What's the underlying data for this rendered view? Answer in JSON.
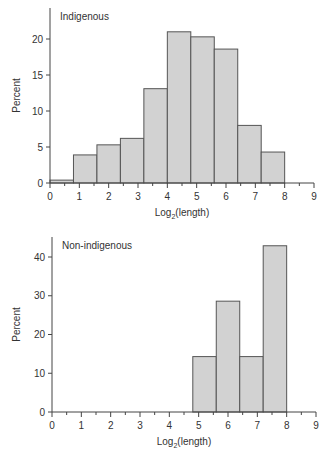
{
  "chart_data": [
    {
      "type": "bar",
      "title": "Indigenous",
      "xlabel": "Log2(length)",
      "ylabel": "Percent",
      "bin_edges": [
        0,
        0.8,
        1.6,
        2.4,
        3.2,
        4.0,
        4.8,
        5.6,
        6.4,
        7.2,
        8.0
      ],
      "values": [
        0.4,
        3.9,
        5.3,
        6.2,
        13.1,
        21.0,
        20.3,
        18.6,
        8.0,
        4.3
      ],
      "xlim": [
        0,
        9
      ],
      "ylim": [
        0,
        24
      ],
      "xticks": [
        "0",
        "1",
        "2",
        "3",
        "4",
        "5",
        "6",
        "7",
        "8",
        "9"
      ],
      "yticks": [
        "0",
        "5",
        "10",
        "15",
        "20"
      ],
      "grid": false,
      "legend": null
    },
    {
      "type": "bar",
      "title": "Non-indigenous",
      "xlabel": "Log2(length)",
      "ylabel": "Percent",
      "bin_edges": [
        4.8,
        5.6,
        6.4,
        7.2,
        8.0
      ],
      "values": [
        14.3,
        28.6,
        14.3,
        42.9
      ],
      "xlim": [
        0,
        9
      ],
      "ylim": [
        0,
        45
      ],
      "xticks": [
        "0",
        "1",
        "2",
        "3",
        "4",
        "5",
        "6",
        "7",
        "8",
        "9"
      ],
      "yticks": [
        "0",
        "10",
        "20",
        "30",
        "40"
      ],
      "grid": false,
      "legend": null
    }
  ],
  "top": {
    "label": "Indigenous",
    "ylabel": "Percent",
    "xlabel_main": "Log",
    "xlabel_sub": "2",
    "xlabel_rest": "(length)"
  },
  "bottom": {
    "label": "Non-indigenous",
    "ylabel": "Percent",
    "xlabel_main": "Log",
    "xlabel_sub": "2",
    "xlabel_rest": "(length)"
  },
  "colors": {
    "bar_fill": "#d2d2d2",
    "bar_stroke": "#555555",
    "axis": "#444444"
  }
}
